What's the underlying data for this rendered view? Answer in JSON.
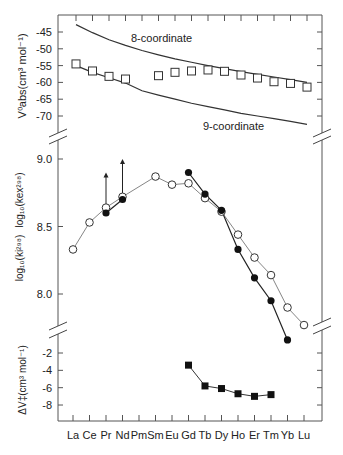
{
  "chart_data": [
    {
      "panel": "top",
      "type": "scatter",
      "ylabel": "V⁰abs(cm³ mol⁻¹)",
      "ylabel_main": "V",
      "ylabel_sup": "0",
      "ylabel_sub": "abs",
      "ylabel_rest": "(cm³ mol⁻¹)",
      "yticks": [
        -45,
        -50,
        -55,
        -60,
        -65,
        -70
      ],
      "ylim": [
        -75,
        -41
      ],
      "categories": [
        "La",
        "Ce",
        "Pr",
        "Nd",
        "Pm",
        "Sm",
        "Eu",
        "Gd",
        "Tb",
        "Dy",
        "Ho",
        "Er",
        "Tm",
        "Yb",
        "Lu"
      ],
      "series": [
        {
          "name": "V0abs",
          "marker": "open-square",
          "values": [
            -54.5,
            -56.6,
            -58.2,
            -59.0,
            null,
            -58.0,
            -57.0,
            -56.6,
            -56.3,
            -56.7,
            -57.8,
            -58.7,
            -59.8,
            -60.3,
            -61.4
          ]
        },
        {
          "name": "8-coordinate",
          "marker": "line",
          "values": [
            -42.8,
            -45.2,
            -47.3,
            -49.0,
            -50.5,
            -51.8,
            -53.0,
            -54.0,
            -55.0,
            -55.9,
            -56.8,
            -57.6,
            -58.4,
            -59.2,
            -60.0
          ]
        },
        {
          "name": "9-coordinate",
          "marker": "line",
          "values": [
            -55.0,
            -57.0,
            -58.6,
            -60.2,
            -62.5,
            -63.8,
            -65.0,
            -66.2,
            -67.2,
            -68.2,
            -69.2,
            -70.0,
            -70.8,
            -71.6,
            -72.5
          ]
        }
      ],
      "annotations": [
        {
          "text": "8-coordinate",
          "at": "Tb",
          "y": -51.0
        },
        {
          "text": "9-coordinate",
          "at": "Ho",
          "y": -73.0
        }
      ]
    },
    {
      "panel": "middle",
      "type": "line",
      "ylabel_ex": "log₁₀(k_ex²⁹⁸)",
      "ylabel_i": "log₁₀(k_i²⁹⁸)",
      "yticks": [
        9.0,
        8.5,
        8.0
      ],
      "ylim": [
        7.75,
        9.2
      ],
      "categories": [
        "La",
        "Ce",
        "Pr",
        "Nd",
        "Pm",
        "Sm",
        "Eu",
        "Gd",
        "Tb",
        "Dy",
        "Ho",
        "Er",
        "Tm",
        "Yb",
        "Lu"
      ],
      "series": [
        {
          "name": "log10(kex298)",
          "marker": "open-circle",
          "line": "dotted",
          "values": [
            8.33,
            8.53,
            8.64,
            8.72,
            null,
            8.87,
            8.81,
            8.82,
            8.71,
            8.61,
            8.44,
            8.27,
            8.14,
            7.9,
            7.77
          ]
        },
        {
          "name": "log10(ki298)",
          "marker": "filled-circle",
          "line": "solid",
          "values": [
            null,
            null,
            8.6,
            8.7,
            null,
            null,
            null,
            8.9,
            8.74,
            8.62,
            8.33,
            8.12,
            7.95,
            7.66,
            null
          ]
        }
      ],
      "arrows": [
        {
          "at": "Pr",
          "from": 8.64,
          "to": 8.9
        },
        {
          "at": "Nd",
          "from": 8.72,
          "to": 9.0
        }
      ]
    },
    {
      "panel": "bottom",
      "type": "line",
      "ylabel": "ΔV‡(cm³ mol⁻¹)",
      "yticks": [
        -2,
        -4,
        -6,
        -8
      ],
      "ylim": [
        -10,
        -0.5
      ],
      "categories": [
        "La",
        "Ce",
        "Pr",
        "Nd",
        "Pm",
        "Sm",
        "Eu",
        "Gd",
        "Tb",
        "Dy",
        "Ho",
        "Er",
        "Tm",
        "Yb",
        "Lu"
      ],
      "series": [
        {
          "name": "ΔV‡",
          "marker": "filled-square",
          "values": [
            null,
            null,
            null,
            null,
            null,
            null,
            null,
            -3.4,
            -5.8,
            -6.1,
            -6.7,
            -7.0,
            -6.8,
            null,
            null
          ]
        }
      ],
      "xlabel": ""
    }
  ],
  "labels": {
    "top_ylabel": "V⁰abs(cm³ mol⁻¹)",
    "mid_ylabel_ex": "log₁₀(kex²⁹⁸)",
    "mid_ylabel_i": "log₁₀(ki²⁹⁸)",
    "bottom_ylabel": "ΔV‡(cm³ mol⁻¹)",
    "line8": "8-coordinate",
    "line9": "9-coordinate"
  },
  "colors": {
    "axis": "#555555",
    "line": "#333333",
    "marker_fill": "#111111",
    "open_fill": "#ffffff"
  }
}
